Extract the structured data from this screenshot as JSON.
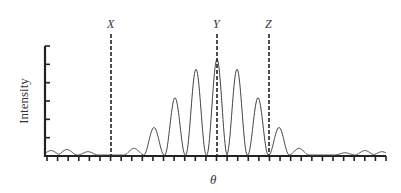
{
  "chart_data": {
    "type": "line",
    "title": "",
    "xlabel": "θ",
    "ylabel": "Intensity",
    "grid": false,
    "legend": null,
    "x_ticks_count": 33,
    "y_ticks_count": 7,
    "markers": [
      {
        "label": "X",
        "x": 111
      },
      {
        "label": "Y",
        "x": 217
      },
      {
        "label": "Z",
        "x": 269
      }
    ],
    "peaks": [
      {
        "x": 51,
        "height": 0.04
      },
      {
        "x": 67,
        "height": 0.05
      },
      {
        "x": 88,
        "height": 0.03
      },
      {
        "x": 134,
        "height": 0.06
      },
      {
        "x": 154,
        "height": 0.25
      },
      {
        "x": 175,
        "height": 0.52
      },
      {
        "x": 196,
        "height": 0.78
      },
      {
        "x": 217,
        "height": 0.87
      },
      {
        "x": 237,
        "height": 0.78
      },
      {
        "x": 258,
        "height": 0.52
      },
      {
        "x": 279,
        "height": 0.25
      },
      {
        "x": 299,
        "height": 0.06
      },
      {
        "x": 345,
        "height": 0.02
      },
      {
        "x": 365,
        "height": 0.04
      },
      {
        "x": 382,
        "height": 0.03
      }
    ]
  },
  "labels": {
    "ylabel": "Intensity",
    "xlabel": "θ",
    "marker_x": "X",
    "marker_y": "Y",
    "marker_z": "Z"
  }
}
